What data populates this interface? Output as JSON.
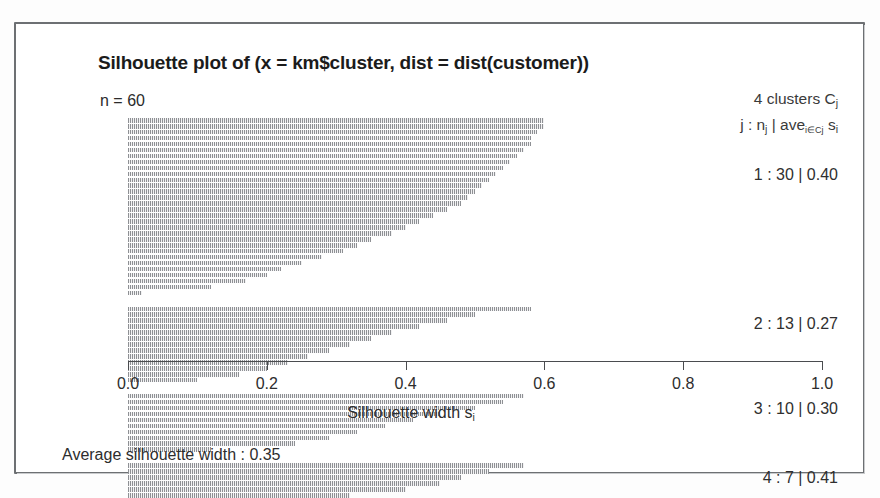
{
  "plot": {
    "title": "Silhouette plot of (x = km$cluster, dist = dist(customer))",
    "n_label": "n = 60",
    "legend_line1_pre": "4  clusters  C",
    "legend_line1_sub": "j",
    "legend_line2_a": "j :  n",
    "legend_line2_sub_a": "j",
    "legend_line2_b": " | ave",
    "legend_line2_sub_b": "i∈Cj",
    "legend_line2_c": "  s",
    "legend_line2_sub_c": "i",
    "xaxis_title_pre": "Silhouette width  s",
    "xaxis_title_sub": "i",
    "footer": "Average silhouette width :  0.35"
  },
  "chart_data": {
    "type": "bar",
    "orientation": "horizontal",
    "title": "Silhouette plot of (x = km$cluster, dist = dist(customer))",
    "subtitle": "n = 60",
    "xlabel": "Silhouette width s_i",
    "ylabel": "",
    "xlim": [
      0.0,
      1.0
    ],
    "grid": false,
    "legend_position": "right",
    "tick_labels": [
      "0.0",
      "0.2",
      "0.4",
      "0.6",
      "0.8",
      "1.0"
    ],
    "tick_values": [
      0.0,
      0.2,
      0.4,
      0.6,
      0.8,
      1.0
    ],
    "total_n": 60,
    "n_clusters": 4,
    "average_silhouette_width": 0.35,
    "clusters": [
      {
        "j": 1,
        "label": "1 :  30  |  0.40",
        "n": 30,
        "ave_sil_width": 0.4,
        "values": [
          0.6,
          0.6,
          0.59,
          0.58,
          0.58,
          0.57,
          0.56,
          0.55,
          0.54,
          0.53,
          0.52,
          0.51,
          0.5,
          0.49,
          0.48,
          0.46,
          0.44,
          0.42,
          0.4,
          0.38,
          0.35,
          0.33,
          0.31,
          0.28,
          0.25,
          0.22,
          0.2,
          0.17,
          0.12,
          0.02
        ]
      },
      {
        "j": 2,
        "label": "2 :  13  |  0.27",
        "n": 13,
        "ave_sil_width": 0.27,
        "values": [
          0.58,
          0.5,
          0.46,
          0.42,
          0.38,
          0.35,
          0.32,
          0.29,
          0.26,
          0.23,
          0.2,
          0.16,
          0.1
        ]
      },
      {
        "j": 3,
        "label": "3 :  10  |  0.30",
        "n": 10,
        "ave_sil_width": 0.3,
        "values": [
          0.57,
          0.54,
          0.5,
          0.45,
          0.41,
          0.37,
          0.33,
          0.29,
          0.24,
          0.12
        ]
      },
      {
        "j": 4,
        "label": "4 :  7  |  0.41",
        "n": 7,
        "ave_sil_width": 0.41,
        "values": [
          0.57,
          0.52,
          0.48,
          0.45,
          0.4,
          0.32,
          0.22
        ]
      }
    ]
  }
}
